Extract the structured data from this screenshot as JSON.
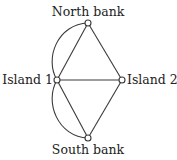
{
  "diagram": {
    "type": "graph",
    "nodes": [
      {
        "id": "north",
        "label": "North bank"
      },
      {
        "id": "island1",
        "label": "Island 1"
      },
      {
        "id": "island2",
        "label": "Island 2"
      },
      {
        "id": "south",
        "label": "South bank"
      }
    ],
    "edges": [
      {
        "from": "island1",
        "to": "north",
        "shape": "straight"
      },
      {
        "from": "island1",
        "to": "north",
        "shape": "curved"
      },
      {
        "from": "island1",
        "to": "south",
        "shape": "straight"
      },
      {
        "from": "island1",
        "to": "south",
        "shape": "curved"
      },
      {
        "from": "island1",
        "to": "island2",
        "shape": "straight"
      },
      {
        "from": "north",
        "to": "island2",
        "shape": "straight"
      },
      {
        "from": "south",
        "to": "island2",
        "shape": "straight"
      }
    ]
  },
  "labels": {
    "north": "North bank",
    "island1": "Island 1",
    "island2": "Island 2",
    "south": "South bank"
  }
}
